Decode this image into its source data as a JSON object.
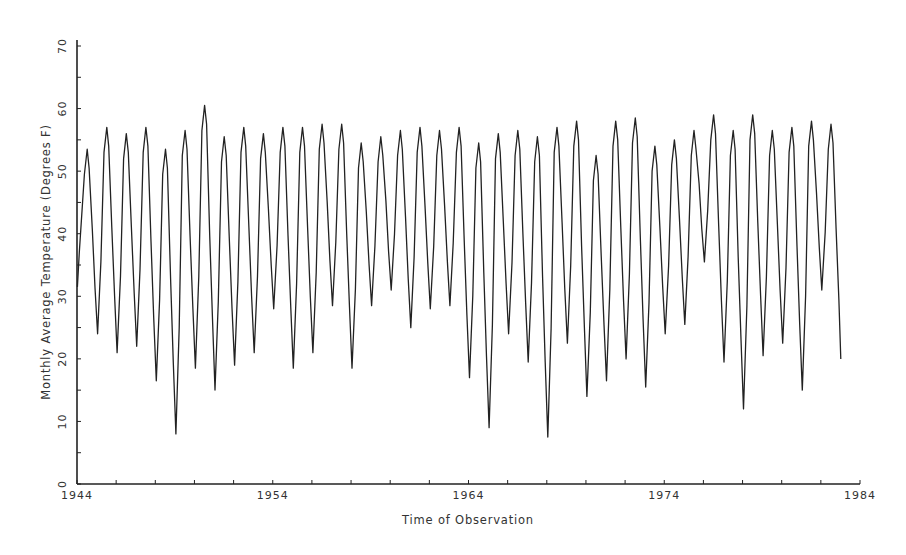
{
  "chart_data": {
    "type": "line",
    "title": "",
    "xlabel": "Time of Observation",
    "ylabel": "Monthly Average Temperature (Degrees F)",
    "xlim": [
      1944,
      1984
    ],
    "ylim": [
      0,
      70
    ],
    "x_ticks": [
      "1944",
      "1954",
      "1964",
      "1974",
      "1984"
    ],
    "x_minor_tick_step": 2,
    "y_ticks": [
      "0",
      "10",
      "20",
      "30",
      "40",
      "50",
      "60",
      "70"
    ],
    "y_minor_tick_step": 5,
    "grid": false,
    "legend": null,
    "series": [
      {
        "name": "Monthly Average Temperature",
        "color": "#222222",
        "note": "Annual summer peaks and winter troughs read from the plot (approximate)",
        "start_value": 31.5,
        "peaks": [
          {
            "year": 1944,
            "value": 53.5
          },
          {
            "year": 1945,
            "value": 57
          },
          {
            "year": 1946,
            "value": 56
          },
          {
            "year": 1947,
            "value": 57
          },
          {
            "year": 1948,
            "value": 53.5
          },
          {
            "year": 1949,
            "value": 56.5
          },
          {
            "year": 1950,
            "value": 60.5
          },
          {
            "year": 1951,
            "value": 55.5
          },
          {
            "year": 1952,
            "value": 57
          },
          {
            "year": 1953,
            "value": 56
          },
          {
            "year": 1954,
            "value": 57
          },
          {
            "year": 1955,
            "value": 57
          },
          {
            "year": 1956,
            "value": 57.5
          },
          {
            "year": 1957,
            "value": 57.5
          },
          {
            "year": 1958,
            "value": 54.5
          },
          {
            "year": 1959,
            "value": 55.5
          },
          {
            "year": 1960,
            "value": 56.5
          },
          {
            "year": 1961,
            "value": 57
          },
          {
            "year": 1962,
            "value": 56.5
          },
          {
            "year": 1963,
            "value": 57
          },
          {
            "year": 1964,
            "value": 54.5
          },
          {
            "year": 1965,
            "value": 56
          },
          {
            "year": 1966,
            "value": 56.5
          },
          {
            "year": 1967,
            "value": 55.5
          },
          {
            "year": 1968,
            "value": 57
          },
          {
            "year": 1969,
            "value": 58
          },
          {
            "year": 1970,
            "value": 52.5
          },
          {
            "year": 1971,
            "value": 58
          },
          {
            "year": 1972,
            "value": 58.5
          },
          {
            "year": 1973,
            "value": 54
          },
          {
            "year": 1974,
            "value": 55
          },
          {
            "year": 1975,
            "value": 56.5
          },
          {
            "year": 1976,
            "value": 59
          },
          {
            "year": 1977,
            "value": 56.5
          },
          {
            "year": 1978,
            "value": 59
          },
          {
            "year": 1979,
            "value": 56.5
          },
          {
            "year": 1980,
            "value": 57
          },
          {
            "year": 1981,
            "value": 58
          },
          {
            "year": 1982,
            "value": 57.5
          }
        ],
        "troughs": [
          {
            "year": 1945,
            "value": 24
          },
          {
            "year": 1946,
            "value": 21
          },
          {
            "year": 1947,
            "value": 22
          },
          {
            "year": 1948,
            "value": 16.5
          },
          {
            "year": 1949,
            "value": 8
          },
          {
            "year": 1950,
            "value": 18.5
          },
          {
            "year": 1951,
            "value": 15
          },
          {
            "year": 1952,
            "value": 19
          },
          {
            "year": 1953,
            "value": 21
          },
          {
            "year": 1954,
            "value": 28
          },
          {
            "year": 1955,
            "value": 18.5
          },
          {
            "year": 1956,
            "value": 21
          },
          {
            "year": 1957,
            "value": 28.5
          },
          {
            "year": 1958,
            "value": 18.5
          },
          {
            "year": 1959,
            "value": 28.5
          },
          {
            "year": 1960,
            "value": 31
          },
          {
            "year": 1961,
            "value": 25
          },
          {
            "year": 1962,
            "value": 28
          },
          {
            "year": 1963,
            "value": 28.5
          },
          {
            "year": 1964,
            "value": 17
          },
          {
            "year": 1965,
            "value": 9
          },
          {
            "year": 1966,
            "value": 24
          },
          {
            "year": 1967,
            "value": 19.5
          },
          {
            "year": 1968,
            "value": 7.5
          },
          {
            "year": 1969,
            "value": 22.5
          },
          {
            "year": 1970,
            "value": 14
          },
          {
            "year": 1971,
            "value": 16.5
          },
          {
            "year": 1972,
            "value": 20
          },
          {
            "year": 1973,
            "value": 15.5
          },
          {
            "year": 1974,
            "value": 24
          },
          {
            "year": 1975,
            "value": 25.5
          },
          {
            "year": 1976,
            "value": 35.5
          },
          {
            "year": 1977,
            "value": 19.5
          },
          {
            "year": 1978,
            "value": 12
          },
          {
            "year": 1979,
            "value": 20.5
          },
          {
            "year": 1980,
            "value": 22.5
          },
          {
            "year": 1981,
            "value": 15
          },
          {
            "year": 1982,
            "value": 31
          },
          {
            "year": 1983,
            "value": 20
          }
        ]
      }
    ]
  }
}
